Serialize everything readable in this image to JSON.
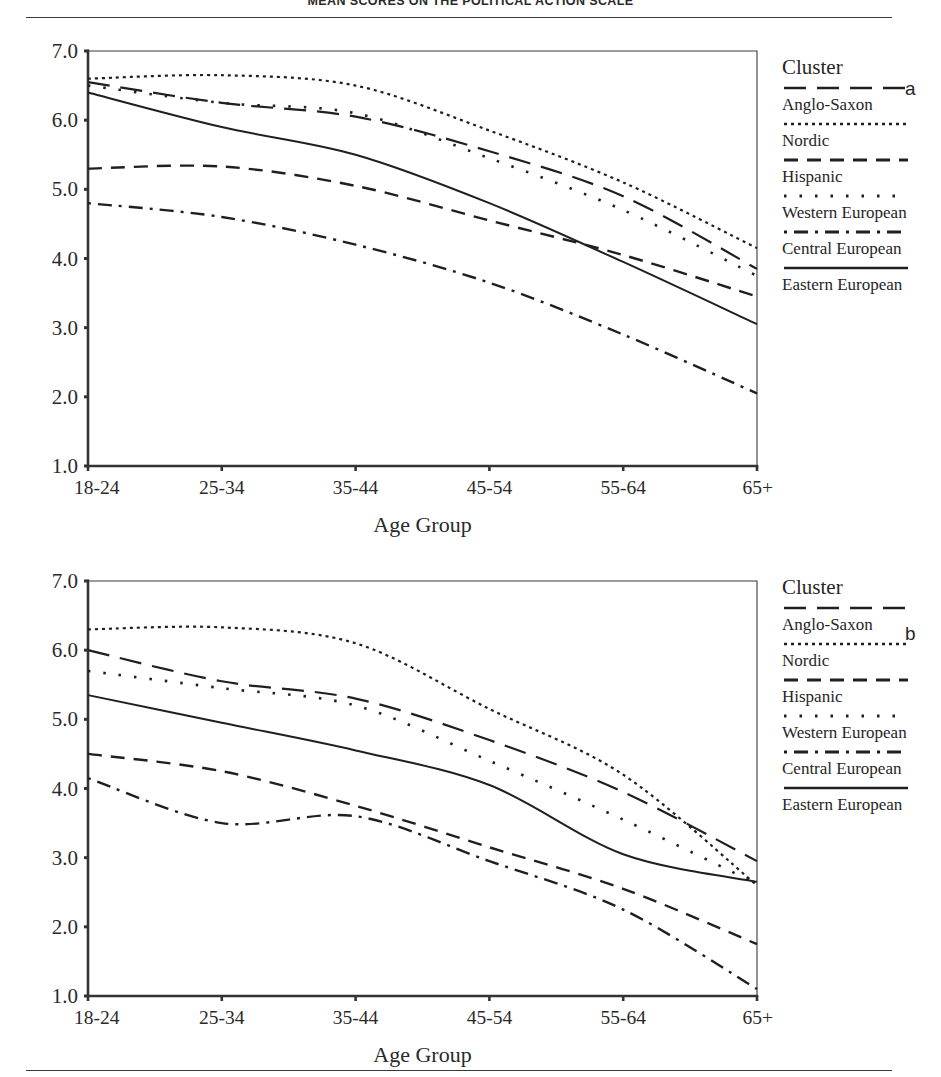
{
  "document": {
    "title": "MEAN SCORES ON THE POLITICAL ACTION SCALE",
    "rule_color": "#3a3a3a"
  },
  "panels": [
    {
      "letter": "a",
      "xlabel": "Age Group",
      "legend_title": "Cluster"
    },
    {
      "letter": "b",
      "xlabel": "Age Group",
      "legend_title": "Cluster"
    }
  ],
  "legend": {
    "title": "Cluster",
    "entries": [
      {
        "label": "Anglo-Saxon",
        "dash": "22,11",
        "width": 2.2
      },
      {
        "label": "Nordic",
        "dash": "3,4",
        "width": 2.2
      },
      {
        "label": "Hispanic",
        "dash": "14,9",
        "width": 2.4
      },
      {
        "label": "Western European",
        "dash": "2.5,13",
        "width": 2.6
      },
      {
        "label": "Central European",
        "dash": "3,7,14,7",
        "width": 2.4
      },
      {
        "label": "Eastern European",
        "dash": "0",
        "width": 2.0
      }
    ]
  },
  "axis": {
    "y_ticks": [
      "7.0",
      "6.0",
      "5.0",
      "4.0",
      "3.0",
      "2.0",
      "1.0"
    ],
    "y_values": [
      7.0,
      6.0,
      5.0,
      4.0,
      3.0,
      2.0,
      1.0
    ],
    "x_ticks": [
      "18-24",
      "25-34",
      "35-44",
      "45-54",
      "55-64",
      "65+"
    ]
  },
  "chart_data": [
    {
      "type": "line",
      "id": "panel-a",
      "title": "MEAN SCORES ON THE POLITICAL ACTION SCALE",
      "panel_label": "a",
      "xlabel": "Age Group",
      "ylabel": "",
      "categories": [
        "18-24",
        "25-34",
        "35-44",
        "45-54",
        "55-64",
        "65+"
      ],
      "ylim": [
        1.0,
        7.0
      ],
      "yticks": [
        1.0,
        2.0,
        3.0,
        4.0,
        5.0,
        6.0,
        7.0
      ],
      "grid": false,
      "legend_position": "right",
      "legend_title": "Cluster",
      "series": [
        {
          "name": "Anglo-Saxon",
          "values": [
            6.55,
            6.25,
            6.05,
            5.55,
            4.9,
            3.85
          ]
        },
        {
          "name": "Nordic",
          "values": [
            6.6,
            6.65,
            6.5,
            5.85,
            5.1,
            4.15
          ]
        },
        {
          "name": "Hispanic",
          "values": [
            5.3,
            5.33,
            5.05,
            4.55,
            4.05,
            3.45
          ]
        },
        {
          "name": "Western European",
          "values": [
            6.5,
            6.25,
            6.1,
            5.45,
            4.7,
            3.75
          ]
        },
        {
          "name": "Central European",
          "values": [
            4.8,
            4.6,
            4.2,
            3.65,
            2.9,
            2.05
          ]
        },
        {
          "name": "Eastern European",
          "values": [
            6.4,
            5.9,
            5.5,
            4.8,
            3.95,
            3.05
          ]
        }
      ]
    },
    {
      "type": "line",
      "id": "panel-b",
      "panel_label": "b",
      "xlabel": "Age Group",
      "ylabel": "",
      "categories": [
        "18-24",
        "25-34",
        "35-44",
        "45-54",
        "55-64",
        "65+"
      ],
      "ylim": [
        1.0,
        7.0
      ],
      "yticks": [
        1.0,
        2.0,
        3.0,
        4.0,
        5.0,
        6.0,
        7.0
      ],
      "grid": false,
      "legend_position": "right",
      "legend_title": "Cluster",
      "series": [
        {
          "name": "Anglo-Saxon",
          "values": [
            6.0,
            5.55,
            5.3,
            4.7,
            3.95,
            2.95
          ]
        },
        {
          "name": "Nordic",
          "values": [
            6.3,
            6.33,
            6.1,
            5.15,
            4.2,
            2.6
          ]
        },
        {
          "name": "Hispanic",
          "values": [
            4.5,
            4.25,
            3.75,
            3.15,
            2.55,
            1.75
          ]
        },
        {
          "name": "Western European",
          "values": [
            5.7,
            5.45,
            5.2,
            4.4,
            3.55,
            2.62
          ]
        },
        {
          "name": "Central European",
          "values": [
            4.15,
            3.5,
            3.6,
            2.95,
            2.25,
            1.1
          ]
        },
        {
          "name": "Eastern European",
          "values": [
            5.35,
            4.95,
            4.55,
            4.05,
            3.05,
            2.65
          ]
        }
      ]
    }
  ]
}
